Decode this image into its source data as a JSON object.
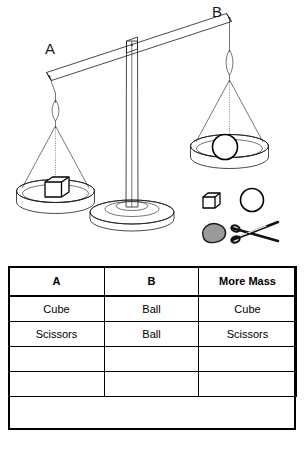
{
  "illustration": {
    "title": "balance-scale-diagram",
    "left_arm_label": "A",
    "right_arm_label": "B",
    "left_pan_object": "cube",
    "right_pan_object": "ball",
    "beam_state": "tilted-down-left",
    "loose_objects": [
      {
        "name": "cube",
        "label": "cube"
      },
      {
        "name": "ball",
        "label": "ball"
      },
      {
        "name": "clay-blob",
        "label": "clay"
      },
      {
        "name": "scissors",
        "label": "scissors"
      }
    ],
    "colors": {
      "outline": "#1a1a1a",
      "fill": "#ffffff",
      "blob_fill": "#9a9a9a",
      "table_border": "#000000"
    }
  },
  "table": {
    "name": "more-mass-comparison-table",
    "headers": [
      "A",
      "B",
      "More Mass"
    ],
    "rows": [
      [
        "Cube",
        "Ball",
        "Cube"
      ],
      [
        "Scissors",
        "Ball",
        "Scissors"
      ],
      [
        "",
        "",
        ""
      ],
      [
        "",
        "",
        ""
      ]
    ]
  },
  "caption": {
    "text": ""
  }
}
